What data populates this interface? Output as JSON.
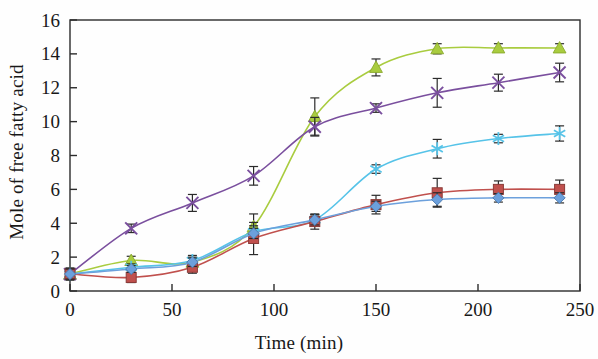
{
  "chart_data": {
    "type": "line",
    "title": "",
    "xlabel": "Time (min)",
    "ylabel": "Mole of free fatty acid",
    "xlim": [
      0,
      250
    ],
    "ylim": [
      0,
      16
    ],
    "xticks": [
      0,
      50,
      100,
      150,
      200,
      250
    ],
    "yticks": [
      0,
      2,
      4,
      6,
      8,
      10,
      12,
      14,
      16
    ],
    "grid": false,
    "legend": "none",
    "x": [
      0,
      30,
      60,
      90,
      120,
      150,
      180,
      210,
      240
    ],
    "series": [
      {
        "name": "series-green-triangle",
        "marker": "triangle",
        "color": "#a9cc3f",
        "values": [
          1.0,
          1.8,
          1.7,
          3.8,
          10.3,
          13.2,
          14.3,
          14.35,
          14.35
        ],
        "errors": [
          0.35,
          0.25,
          0.3,
          0.75,
          1.1,
          0.5,
          0.3,
          0.25,
          0.25
        ]
      },
      {
        "name": "series-purple-x",
        "marker": "x",
        "color": "#7a4f9e",
        "values": [
          1.0,
          3.7,
          5.2,
          6.8,
          9.7,
          10.8,
          11.7,
          12.3,
          12.9
        ],
        "errors": [
          0.3,
          0.25,
          0.5,
          0.55,
          0.55,
          0.25,
          0.85,
          0.5,
          0.55
        ]
      },
      {
        "name": "series-cyan-asterisk",
        "marker": "asterisk",
        "color": "#56c3e8",
        "values": [
          1.0,
          1.4,
          1.8,
          3.5,
          4.2,
          7.2,
          8.4,
          9.0,
          9.3
        ],
        "errors": [
          0.3,
          0.2,
          0.3,
          0.35,
          0.3,
          0.25,
          0.55,
          0.25,
          0.45
        ]
      },
      {
        "name": "series-red-square",
        "marker": "square",
        "color": "#c0504d",
        "values": [
          1.0,
          0.8,
          1.4,
          3.1,
          4.1,
          5.1,
          5.8,
          6.0,
          6.0
        ],
        "errors": [
          0.35,
          0.3,
          0.35,
          0.95,
          0.45,
          0.55,
          0.85,
          0.5,
          0.55
        ]
      },
      {
        "name": "series-blue-diamond",
        "marker": "diamond",
        "color": "#6ca0dc",
        "values": [
          1.0,
          1.3,
          1.7,
          3.4,
          4.2,
          5.0,
          5.4,
          5.5,
          5.5
        ],
        "errors": [
          0.3,
          0.2,
          0.25,
          0.3,
          0.3,
          0.3,
          0.4,
          0.25,
          0.3
        ]
      }
    ]
  },
  "axis": {
    "ylabel": "Mole of free fatty acid",
    "xlabel": "Time (min)",
    "xtick_labels": [
      "0",
      "50",
      "100",
      "150",
      "200",
      "250"
    ],
    "ytick_labels": [
      "0",
      "2",
      "4",
      "6",
      "8",
      "10",
      "12",
      "14",
      "16"
    ]
  }
}
